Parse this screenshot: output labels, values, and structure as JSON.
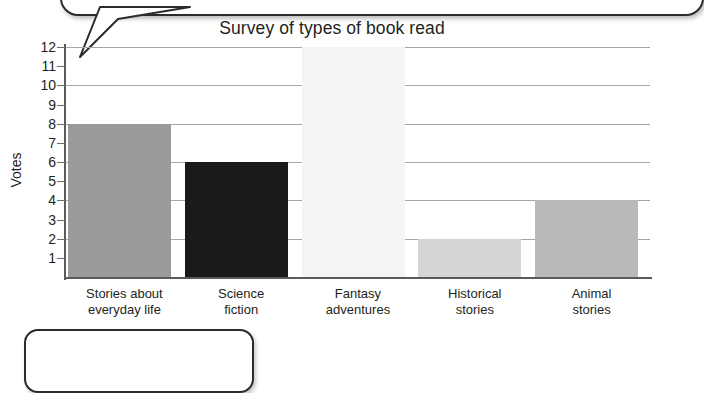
{
  "chart_data": {
    "type": "bar",
    "title": "Survey of types of book read",
    "xlabel": "",
    "ylabel": "Votes",
    "categories": [
      "Stories about everyday life",
      "Science fiction",
      "Fantasy adventures",
      "Historical stories",
      "Animal stories"
    ],
    "category_lines": [
      [
        "Stories about",
        "everyday life"
      ],
      [
        "Science",
        "fiction"
      ],
      [
        "Fantasy",
        "adventures"
      ],
      [
        "Historical",
        "stories"
      ],
      [
        "Animal",
        "stories"
      ]
    ],
    "values": [
      8,
      6,
      12,
      2,
      4
    ],
    "bar_colors": [
      "#9a9a9a",
      "#1a1a1a",
      "#f4f4f4",
      "#d6d6d6",
      "#b9b9b9"
    ],
    "ylim": [
      0,
      12
    ],
    "ytick_labels": [
      "12",
      "11",
      "10",
      "9",
      "8",
      "7",
      "6",
      "5",
      "4",
      "3",
      "2",
      "1"
    ],
    "ytick_values": [
      12,
      11,
      10,
      9,
      8,
      7,
      6,
      5,
      4,
      3,
      2,
      1
    ],
    "gridline_values": [
      12,
      10,
      8,
      6,
      4,
      2
    ],
    "grid": true,
    "legend": false
  },
  "decorations": {
    "speech_bubble_top": "speech-bubble",
    "rounded_box_bottom": "rounded-callout-box"
  }
}
